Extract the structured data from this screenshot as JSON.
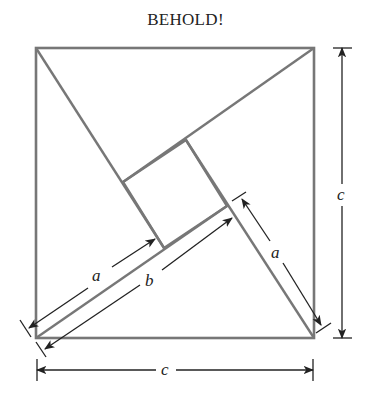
{
  "title": "BEHOLD!",
  "labels": {
    "a_left": "a",
    "b": "b",
    "a_right": "a",
    "c_right": "c",
    "c_bottom": "c"
  },
  "colors": {
    "shape_stroke": "#777777",
    "dimension_stroke": "#222222",
    "background": "#ffffff"
  },
  "geometry": {
    "outer_square": {
      "x": 36,
      "y": 48,
      "size": 278
    },
    "inner_square": [
      [
        123,
        182
      ],
      [
        186,
        140
      ],
      [
        227,
        206
      ],
      [
        164,
        248
      ]
    ]
  }
}
